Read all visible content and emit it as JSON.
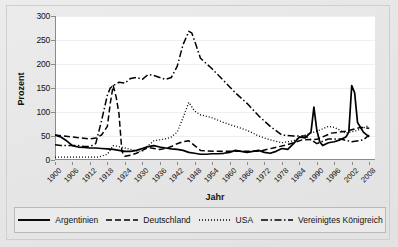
{
  "chart_data": {
    "type": "line",
    "title": "",
    "xlabel": "Jahr",
    "ylabel": "Prozent",
    "xlim": [
      1900,
      2010
    ],
    "ylim": [
      0,
      300
    ],
    "ytick_values": [
      0,
      50,
      100,
      150,
      200,
      250,
      300
    ],
    "ytick_labels": [
      "0",
      "50",
      "100",
      "150",
      "200",
      "250",
      "300"
    ],
    "xtick_labels": [
      "1900",
      "1906",
      "1912",
      "1918",
      "1924",
      "1930",
      "1936",
      "1942",
      "1948",
      "1954",
      "1960",
      "1966",
      "1972",
      "1978",
      "1984",
      "1990",
      "1996",
      "2002",
      "2008"
    ],
    "grid": true,
    "legend_position": "bottom",
    "series": [
      {
        "name": "Argentinien",
        "style": "solid",
        "color": "#000000",
        "x": [
          1900,
          1902,
          1904,
          1906,
          1908,
          1910,
          1912,
          1914,
          1916,
          1918,
          1920,
          1922,
          1924,
          1926,
          1928,
          1930,
          1932,
          1934,
          1936,
          1938,
          1940,
          1942,
          1944,
          1946,
          1948,
          1950,
          1952,
          1954,
          1956,
          1958,
          1960,
          1962,
          1964,
          1966,
          1968,
          1970,
          1972,
          1974,
          1976,
          1978,
          1980,
          1982,
          1984,
          1986,
          1988,
          1989,
          1990,
          1991,
          1992,
          1994,
          1996,
          1998,
          2000,
          2001,
          2002,
          2003,
          2004,
          2006,
          2008
        ],
        "y": [
          52,
          48,
          40,
          30,
          27,
          26,
          25,
          25,
          24,
          23,
          22,
          20,
          18,
          18,
          20,
          24,
          28,
          30,
          27,
          25,
          23,
          22,
          20,
          16,
          14,
          12,
          12,
          13,
          13,
          14,
          16,
          20,
          18,
          16,
          18,
          20,
          16,
          14,
          18,
          24,
          22,
          34,
          48,
          46,
          58,
          110,
          62,
          38,
          30,
          36,
          38,
          42,
          48,
          58,
          155,
          140,
          78,
          58,
          48
        ]
      },
      {
        "name": "Deutschland",
        "style": "dashed",
        "color": "#000000",
        "x": [
          1900,
          1903,
          1906,
          1909,
          1912,
          1914,
          1916,
          1918,
          1919,
          1920,
          1921,
          1922,
          1923,
          1924,
          1926,
          1928,
          1930,
          1932,
          1934,
          1936,
          1938,
          1940,
          1942,
          1944,
          1946,
          1950,
          1955,
          1960,
          1965,
          1970,
          1975,
          1980,
          1985,
          1990,
          1995,
          2000,
          2005,
          2008
        ],
        "y": [
          52,
          50,
          48,
          46,
          44,
          46,
          52,
          70,
          118,
          155,
          132,
          96,
          18,
          8,
          10,
          14,
          20,
          26,
          24,
          22,
          24,
          28,
          34,
          38,
          40,
          20,
          18,
          18,
          18,
          18,
          25,
          32,
          42,
          43,
          56,
          60,
          68,
          66
        ]
      },
      {
        "name": "USA",
        "style": "dotted",
        "color": "#000000",
        "x": [
          1900,
          1905,
          1910,
          1915,
          1918,
          1920,
          1922,
          1924,
          1926,
          1928,
          1930,
          1932,
          1934,
          1936,
          1938,
          1940,
          1942,
          1944,
          1946,
          1948,
          1950,
          1954,
          1958,
          1962,
          1966,
          1970,
          1974,
          1978,
          1982,
          1986,
          1990,
          1994,
          1996,
          2000,
          2004,
          2008
        ],
        "y": [
          6,
          6,
          6,
          6,
          12,
          30,
          28,
          25,
          22,
          19,
          18,
          30,
          40,
          42,
          44,
          48,
          58,
          88,
          120,
          102,
          94,
          88,
          78,
          70,
          62,
          50,
          42,
          36,
          40,
          52,
          60,
          70,
          68,
          56,
          62,
          72
        ]
      },
      {
        "name": "Vereinigtes Königreich",
        "style": "dashdot",
        "color": "#000000",
        "x": [
          1900,
          1902,
          1904,
          1906,
          1908,
          1910,
          1912,
          1914,
          1916,
          1918,
          1919,
          1920,
          1922,
          1924,
          1926,
          1928,
          1930,
          1932,
          1934,
          1936,
          1938,
          1940,
          1942,
          1944,
          1946,
          1947,
          1948,
          1950,
          1954,
          1958,
          1962,
          1966,
          1970,
          1974,
          1978,
          1982,
          1986,
          1990,
          1994,
          1998,
          2002,
          2006,
          2008
        ],
        "y": [
          32,
          30,
          30,
          30,
          30,
          28,
          28,
          34,
          82,
          135,
          150,
          155,
          162,
          160,
          170,
          172,
          168,
          178,
          176,
          172,
          168,
          172,
          195,
          240,
          268,
          265,
          248,
          212,
          190,
          165,
          140,
          118,
          92,
          70,
          52,
          50,
          50,
          34,
          44,
          44,
          38,
          42,
          52
        ]
      }
    ]
  },
  "axes": {
    "y_title": "Prozent",
    "x_title": "Jahr"
  },
  "legend": {
    "items": [
      {
        "label": "Argentinien",
        "style": "solid"
      },
      {
        "label": "Deutschland",
        "style": "dashed"
      },
      {
        "label": "USA",
        "style": "dotted"
      },
      {
        "label": "Vereinigtes Königreich",
        "style": "dashdot"
      }
    ]
  },
  "colors": {
    "line": "#000000",
    "plot_background": "#ffffff",
    "figure_background": "#e8e8e8",
    "axis": "#8a8a8a",
    "grid": "#efefef"
  }
}
